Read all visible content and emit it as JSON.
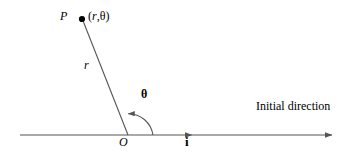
{
  "figure": {
    "type": "polar-coordinate-diagram",
    "background": "#ffffff",
    "stroke_color": "#555555",
    "text_color": "#000000",
    "width": 352,
    "height": 155
  },
  "labels": {
    "point_p": "P",
    "coordinates_open": "(",
    "coordinates_r": "r",
    "coordinates_comma": ",",
    "coordinates_theta": "θ",
    "coordinates_close": ")",
    "radius": "r",
    "angle": "θ",
    "origin": "O",
    "unit_vector": "i",
    "initial_direction": "Initial direction"
  },
  "geometry": {
    "origin_point": {
      "x": 128,
      "y": 135
    },
    "point_p": {
      "x": 82,
      "y": 19
    },
    "axis_start": {
      "x": 20,
      "y": 135
    },
    "axis_end": {
      "x": 332,
      "y": 135
    },
    "axis_arrow_mid": {
      "x": 192,
      "y": 135
    },
    "arc_start": {
      "x": 152,
      "y": 135
    },
    "arc_end": {
      "x": 125,
      "y": 112
    },
    "arc_radius": 25,
    "radial_line_angle_deg": 112
  }
}
